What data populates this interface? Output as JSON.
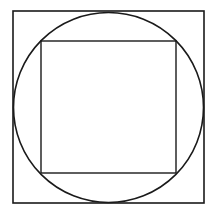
{
  "figure": {
    "title": "Nested geometric figure: square, inscribed circle, inscribed square",
    "canvas": {
      "width": 217,
      "height": 217,
      "background_color": "#ffffff"
    },
    "shapes": [
      {
        "name": "outer-square",
        "type": "square",
        "x": 13,
        "y": 11,
        "width": 191,
        "height": 192,
        "stroke_color": "#1a1a1a",
        "stroke_width": 1.6,
        "fill": "none",
        "label": "Outer square"
      },
      {
        "name": "inscribed-circle",
        "type": "circle",
        "cx": 108.5,
        "cy": 107.5,
        "r": 95,
        "stroke_color": "#1a1a1a",
        "stroke_width": 1.6,
        "fill": "none",
        "label": "Inscribed circle"
      },
      {
        "name": "inner-square",
        "type": "square",
        "x": 41,
        "y": 41,
        "width": 135,
        "height": 132,
        "stroke_color": "#1a1a1a",
        "stroke_width": 1.4,
        "fill": "none",
        "label": "Inner square"
      }
    ],
    "colors": {
      "stroke": "#1a1a1a",
      "background": "#ffffff",
      "fill": "none"
    }
  }
}
